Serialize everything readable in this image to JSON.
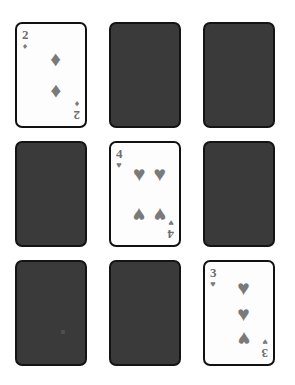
{
  "board": {
    "title": "Memory card grid",
    "rows": 3,
    "columns": 3,
    "background_color": "#ffffff",
    "card_back_color": "#3a3a3a",
    "card_face_color": "#fdfdfd",
    "card_border_color": "#111111",
    "pip_color": "#7a7a7a"
  },
  "suit_glyphs": {
    "hearts": "♥",
    "diamonds": "♦",
    "spades": "♠",
    "clubs": "♣"
  },
  "cards": [
    {
      "position": "row1-col1",
      "state": "face-up",
      "rank": "2",
      "suit": "diamonds",
      "suit_glyph": "♦",
      "pip_count": 2
    },
    {
      "position": "row1-col2",
      "state": "face-down",
      "rank": "",
      "suit": "",
      "suit_glyph": "",
      "pip_count": 0
    },
    {
      "position": "row1-col3",
      "state": "face-down",
      "rank": "",
      "suit": "",
      "suit_glyph": "",
      "pip_count": 0
    },
    {
      "position": "row2-col1",
      "state": "face-down",
      "rank": "",
      "suit": "",
      "suit_glyph": "",
      "pip_count": 0
    },
    {
      "position": "row2-col2",
      "state": "face-up",
      "rank": "4",
      "suit": "hearts",
      "suit_glyph": "♥",
      "pip_count": 4
    },
    {
      "position": "row2-col3",
      "state": "face-down",
      "rank": "",
      "suit": "",
      "suit_glyph": "",
      "pip_count": 0
    },
    {
      "position": "row3-col1",
      "state": "face-down",
      "rank": "",
      "suit": "",
      "suit_glyph": "",
      "pip_count": 0
    },
    {
      "position": "row3-col2",
      "state": "face-down",
      "rank": "",
      "suit": "",
      "suit_glyph": "",
      "pip_count": 0
    },
    {
      "position": "row3-col3",
      "state": "face-up",
      "rank": "3",
      "suit": "hearts",
      "suit_glyph": "♥",
      "pip_count": 3
    }
  ]
}
